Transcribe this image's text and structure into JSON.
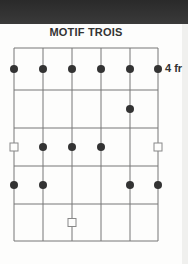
{
  "title": "MOTIF TROIS",
  "fret_label": "4 fr",
  "grid": {
    "strings_x": [
      14,
      43,
      72,
      101,
      130,
      158
    ],
    "frets_y": [
      48,
      90,
      128,
      166,
      204,
      241
    ],
    "line_color": "#777777"
  },
  "markers": [
    {
      "type": "dot",
      "string": 1,
      "row": 1
    },
    {
      "type": "dot",
      "string": 2,
      "row": 1
    },
    {
      "type": "dot",
      "string": 3,
      "row": 1
    },
    {
      "type": "dot",
      "string": 4,
      "row": 1
    },
    {
      "type": "dot",
      "string": 5,
      "row": 1
    },
    {
      "type": "dot",
      "string": 6,
      "row": 1
    },
    {
      "type": "dot",
      "string": 5,
      "row": 2
    },
    {
      "type": "square",
      "string": 1,
      "row": 3
    },
    {
      "type": "dot",
      "string": 2,
      "row": 3
    },
    {
      "type": "dot",
      "string": 3,
      "row": 3
    },
    {
      "type": "dot",
      "string": 4,
      "row": 3
    },
    {
      "type": "square",
      "string": 6,
      "row": 3
    },
    {
      "type": "dot",
      "string": 1,
      "row": 4
    },
    {
      "type": "dot",
      "string": 2,
      "row": 4
    },
    {
      "type": "dot",
      "string": 5,
      "row": 4
    },
    {
      "type": "dot",
      "string": 6,
      "row": 4
    },
    {
      "type": "square",
      "string": 3,
      "row": 5
    }
  ],
  "colors": {
    "dot": "#333333",
    "square_border": "#888888",
    "header_band": "#2e2e2e"
  }
}
